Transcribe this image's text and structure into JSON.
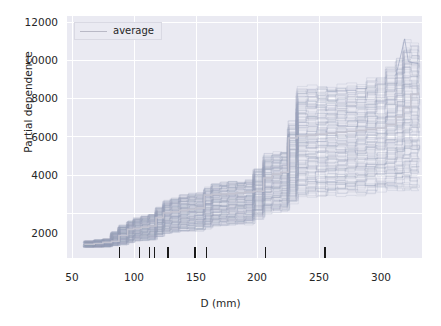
{
  "chart_data": {
    "type": "line",
    "title": "",
    "xlabel": "D (mm)",
    "ylabel": "Partial dependence",
    "xlim": [
      46,
      333
    ],
    "ylim": [
      0,
      12700
    ],
    "xticks": [
      50,
      100,
      150,
      200,
      250,
      300
    ],
    "yticks": [
      2000,
      4000,
      6000,
      8000,
      10000,
      12000
    ],
    "grid": true,
    "legend": {
      "position": "upper-left",
      "entries": [
        {
          "label": "average",
          "color": "#b9b9c6",
          "style": "solid"
        }
      ]
    },
    "plot_kind": "ICE / partial-dependence plot: many individual conditional expectation curves (light blue-grey, semi-transparent) plus a thicker average curve",
    "ice_curve_color": "#9aa3bd",
    "average_curve_color": "#c3c3d0",
    "rug_marks": {
      "description": "deciles of the D (mm) feature distribution drawn as short vertical ticks on the x-axis",
      "values": [
        88,
        104,
        112,
        116,
        127,
        149,
        158,
        206,
        254
      ]
    },
    "series": [
      {
        "name": "average",
        "x": [
          60,
          68,
          75,
          82,
          88,
          95,
          100,
          106,
          112,
          118,
          124,
          130,
          137,
          144,
          150,
          157,
          163,
          170,
          176,
          183,
          190,
          197,
          205,
          212,
          219,
          225,
          232,
          240,
          248,
          256,
          264,
          272,
          280,
          288,
          296,
          304,
          312,
          318,
          324,
          330
        ],
        "values": [
          720,
          760,
          820,
          880,
          1180,
          1500,
          1560,
          1620,
          1680,
          2120,
          2360,
          2420,
          2500,
          2560,
          2620,
          3300,
          3340,
          3360,
          3380,
          3420,
          3460,
          3500,
          4200,
          4400,
          4500,
          6300,
          6400,
          6450,
          6500,
          6550,
          6600,
          6650,
          6700,
          6750,
          6820,
          7000,
          7400,
          7900,
          8600,
          8700
        ]
      },
      {
        "name": "ICE band upper envelope",
        "x": [
          60,
          75,
          88,
          100,
          112,
          124,
          137,
          150,
          163,
          176,
          190,
          205,
          219,
          232,
          248,
          264,
          280,
          296,
          312,
          320,
          330
        ],
        "values": [
          900,
          1000,
          1700,
          2100,
          2300,
          3000,
          3300,
          3400,
          3900,
          4000,
          4050,
          5400,
          5600,
          8900,
          8950,
          9000,
          9050,
          9500,
          10400,
          11500,
          10600
        ]
      },
      {
        "name": "ICE band lower envelope",
        "x": [
          60,
          75,
          88,
          100,
          112,
          124,
          137,
          150,
          163,
          176,
          190,
          205,
          219,
          232,
          248,
          264,
          280,
          296,
          312,
          320,
          330
        ],
        "values": [
          560,
          580,
          700,
          900,
          950,
          1300,
          1400,
          1450,
          1700,
          1750,
          1800,
          2400,
          2500,
          3300,
          3350,
          3400,
          3450,
          3550,
          3600,
          3650,
          3700
        ]
      }
    ]
  },
  "axes": {
    "y_tick_labels": [
      "12000",
      "10000",
      "8000",
      "6000",
      "4000",
      "2000"
    ],
    "x_tick_labels": [
      "50",
      "100",
      "150",
      "200",
      "250",
      "300"
    ]
  }
}
